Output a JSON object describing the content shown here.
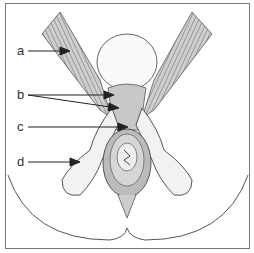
{
  "figure": {
    "type": "anatomical illustration",
    "labels": [
      {
        "id": "a",
        "text": "a",
        "x": 18,
        "y": 45
      },
      {
        "id": "b",
        "text": "b",
        "x": 18,
        "y": 89
      },
      {
        "id": "c",
        "text": "c",
        "x": 18,
        "y": 123
      },
      {
        "id": "d",
        "text": "d",
        "x": 18,
        "y": 160
      }
    ]
  }
}
